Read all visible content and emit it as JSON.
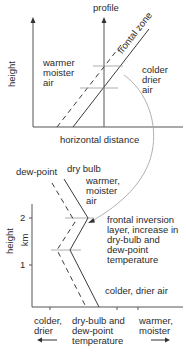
{
  "top_diagram": {
    "y_axis_label": "height",
    "x_axis_label": "horizontal distance",
    "profile_label": "profile",
    "frontal_zone_label": "frontal zone",
    "warm_air_label": "warmer\nmoister\nair",
    "cold_air_label": "colder\ndrier\nair"
  },
  "bottom_diagram": {
    "dew_point_label": "dew-point",
    "dry_bulb_label": "dry bulb",
    "upper_air_label": "warmer,\nmoister\nair",
    "inversion_label": "frontal inversion\nlayer, increase in\ndry-bulb and\ndew-point\ntemperature",
    "lower_air_label": "colder, drier air",
    "y_axis_label_line1": "height",
    "y_axis_label_line2": "km",
    "y_ticks": [
      "2",
      "1"
    ],
    "x_axis_left_label": "colder,\ndrier",
    "x_axis_center_label": "dry-bulb and\ndew-point\ntemperature",
    "x_axis_right_label": "warmer,\nmoister",
    "left_arrow": "←",
    "right_arrow": "→"
  },
  "colors": {
    "line": "#3a3a3a",
    "axis": "#555555",
    "tick_line": "#9a9a9a",
    "curve": "#a8a8a8"
  }
}
